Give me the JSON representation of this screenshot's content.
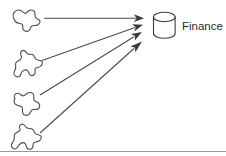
{
  "diagram": {
    "type": "flow-diagram",
    "title": "",
    "background_color": "#ffffff",
    "stroke_color": "#4a4a4a",
    "text_color": "#2b2b2b",
    "target": {
      "label": "Finance",
      "icon": "database-cylinder-icon",
      "shape": "cylinder"
    },
    "sources": [
      {
        "index": 1,
        "label": "",
        "icon": "irregular-blob-icon"
      },
      {
        "index": 2,
        "label": "",
        "icon": "irregular-blob-icon"
      },
      {
        "index": 3,
        "label": "",
        "icon": "irregular-blob-icon"
      },
      {
        "index": 4,
        "label": "",
        "icon": "irregular-blob-icon"
      }
    ],
    "connectors": [
      {
        "from": "source-1",
        "to": "finance-database",
        "style": "arrow"
      },
      {
        "from": "source-2",
        "to": "finance-database",
        "style": "arrow"
      },
      {
        "from": "source-3",
        "to": "finance-database",
        "style": "arrow"
      },
      {
        "from": "source-4",
        "to": "finance-database",
        "style": "arrow"
      }
    ],
    "footer_rule": true
  }
}
